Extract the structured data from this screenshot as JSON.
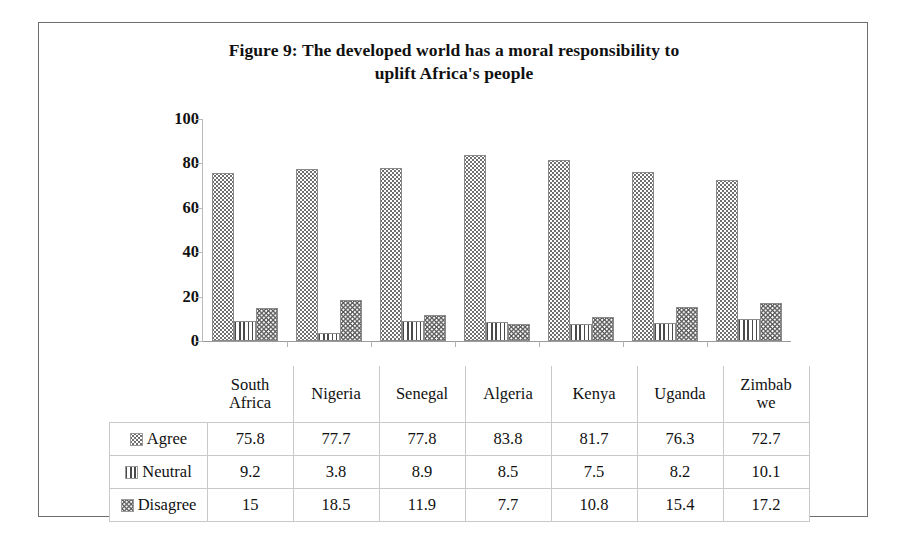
{
  "figure": {
    "title_line1": "Figure 9: The developed world has a moral responsibility to",
    "title_line2": "uplift Africa's people",
    "title_full": "Figure 9: The developed world has a moral responsibility to uplift Africa's people"
  },
  "axis": {
    "y_ticks": [
      "100",
      "80",
      "60",
      "40",
      "20",
      "0"
    ]
  },
  "table": {
    "legend_header": "",
    "series_labels": [
      "Agree",
      "Neutral",
      "Disagree"
    ],
    "categories": [
      "South Africa",
      "Nigeria",
      "Senegal",
      "Algeria",
      "Kenya",
      "Uganda",
      "Zimbabwe"
    ],
    "category_display": [
      {
        "line1": "South",
        "line2": "Africa"
      },
      {
        "line1": "Nigeria",
        "line2": ""
      },
      {
        "line1": "Senegal",
        "line2": ""
      },
      {
        "line1": "Algeria",
        "line2": ""
      },
      {
        "line1": "Kenya",
        "line2": ""
      },
      {
        "line1": "Uganda",
        "line2": ""
      },
      {
        "line1": "Zimbab",
        "line2": "we"
      }
    ],
    "rows": [
      {
        "label": "Agree",
        "swatch": "dotted-pattern-swatch",
        "values": [
          "75.8",
          "77.7",
          "77.8",
          "83.8",
          "81.7",
          "76.3",
          "72.7"
        ]
      },
      {
        "label": "Neutral",
        "swatch": "vertical-lines-swatch",
        "values": [
          "9.2",
          "3.8",
          "8.9",
          "8.5",
          "7.5",
          "8.2",
          "10.1"
        ]
      },
      {
        "label": "Disagree",
        "swatch": "wavy-lines-swatch",
        "values": [
          "15",
          "18.5",
          "11.9",
          "7.7",
          "10.8",
          "15.4",
          "17.2"
        ]
      }
    ]
  },
  "chart_data": {
    "type": "bar",
    "title": "Figure 9: The developed world has a moral responsibility to uplift Africa's people",
    "xlabel": "",
    "ylabel": "",
    "ylim": [
      0,
      100
    ],
    "yticks": [
      0,
      20,
      40,
      60,
      80,
      100
    ],
    "grid": false,
    "legend_position": "table-below",
    "categories": [
      "South Africa",
      "Nigeria",
      "Senegal",
      "Algeria",
      "Kenya",
      "Uganda",
      "Zimbabwe"
    ],
    "series": [
      {
        "name": "Agree",
        "pattern": "dots",
        "values": [
          75.8,
          77.7,
          77.8,
          83.8,
          81.7,
          76.3,
          72.7
        ]
      },
      {
        "name": "Neutral",
        "pattern": "vertical-lines",
        "values": [
          9.2,
          3.8,
          8.9,
          8.5,
          7.5,
          8.2,
          10.1
        ]
      },
      {
        "name": "Disagree",
        "pattern": "wavy-lines",
        "values": [
          15,
          18.5,
          11.9,
          7.7,
          10.8,
          15.4,
          17.2
        ]
      }
    ]
  },
  "colors": {
    "frame": "#6e6e6e",
    "axis": "#b9b9b9",
    "baseline": "#9a9a9a",
    "table_grid": "#c9c9c9",
    "bar_outline": "#8a8a8a",
    "text": "#111111"
  }
}
